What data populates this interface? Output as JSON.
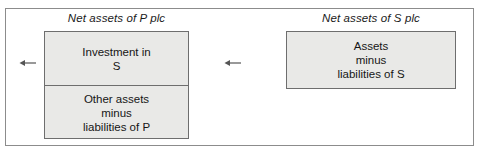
{
  "diagram": {
    "panels": [
      {
        "id": "p-plc",
        "title": "Net assets of P plc",
        "box": {
          "sections": [
            {
              "id": "investment-in-s",
              "lines": [
                "Investment in",
                "S"
              ]
            },
            {
              "id": "other-assets-minus-liabilities-of-p",
              "lines": [
                "Other assets",
                "minus",
                "liabilities of P"
              ]
            }
          ]
        }
      },
      {
        "id": "s-plc",
        "title": "Net assets of S plc",
        "box": {
          "sections": [
            {
              "id": "assets-minus-liabilities-of-s",
              "lines": [
                "Assets",
                "minus",
                "liabilities of S"
              ]
            }
          ]
        }
      }
    ],
    "arrows": [
      {
        "id": "arrow-left-outer",
        "glyph": "left-arrow",
        "direction": "left"
      },
      {
        "id": "arrow-left-inner",
        "glyph": "left-arrow",
        "direction": "left"
      }
    ],
    "colors": {
      "box_fill": "#e9e9e7",
      "box_border": "#6e6e6e",
      "frame_border": "#8c8c8c",
      "text": "#161616",
      "arrow": "#555555",
      "background": "#ffffff"
    }
  }
}
